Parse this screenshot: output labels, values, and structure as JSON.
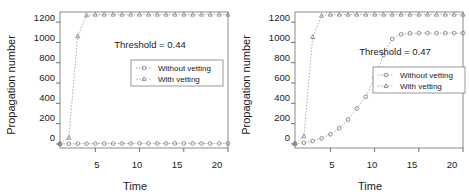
{
  "figure": {
    "panel_count": 2
  },
  "chart_data": [
    {
      "type": "line",
      "title": "",
      "panel_id": "left",
      "xlabel": "Time",
      "ylabel": "Propagation number",
      "xlim": [
        1,
        20
      ],
      "ylim": [
        -40,
        1300
      ],
      "xticks": [
        5,
        10,
        15,
        20
      ],
      "xticklabels": [
        "5",
        "10",
        "15",
        "20"
      ],
      "yticks": [
        0,
        200,
        400,
        600,
        800,
        1000,
        1200
      ],
      "yticklabels": [
        "0",
        "200",
        "400",
        "600",
        "800",
        "1000",
        "1200"
      ],
      "grid": false,
      "legend_position": "center-right",
      "annotation": "Threshold = 0.44",
      "x": [
        1,
        2,
        3,
        4,
        5,
        6,
        7,
        8,
        9,
        10,
        11,
        12,
        13,
        14,
        15,
        16,
        17,
        18,
        19,
        20
      ],
      "series": [
        {
          "name": "Without vetting",
          "marker": "circle",
          "values": [
            1,
            2,
            3,
            3,
            4,
            4,
            4,
            4,
            5,
            5,
            5,
            5,
            5,
            5,
            5,
            5,
            5,
            5,
            5,
            5
          ]
        },
        {
          "name": "With vetting",
          "marker": "triangle",
          "values": [
            3,
            62,
            1063,
            1268,
            1275,
            1275,
            1275,
            1275,
            1275,
            1275,
            1275,
            1275,
            1275,
            1275,
            1275,
            1275,
            1275,
            1275,
            1275,
            1275
          ]
        }
      ]
    },
    {
      "type": "line",
      "title": "",
      "panel_id": "right",
      "xlabel": "Time",
      "ylabel": "Propagation number",
      "xlim": [
        1,
        20
      ],
      "ylim": [
        -40,
        1300
      ],
      "xticks": [
        5,
        10,
        15,
        20
      ],
      "xticklabels": [
        "5",
        "10",
        "15",
        "20"
      ],
      "yticks": [
        0,
        200,
        400,
        600,
        800,
        1000,
        1200
      ],
      "yticklabels": [
        "0",
        "200",
        "400",
        "600",
        "800",
        "1000",
        "1200"
      ],
      "grid": false,
      "legend_position": "center-right",
      "annotation": "Threshold = 0.47",
      "x": [
        1,
        2,
        3,
        4,
        5,
        6,
        7,
        8,
        9,
        10,
        11,
        12,
        13,
        14,
        15,
        16,
        17,
        18,
        19,
        20
      ],
      "series": [
        {
          "name": "Without vetting",
          "marker": "circle",
          "values": [
            2,
            12,
            28,
            55,
            95,
            155,
            240,
            350,
            465,
            650,
            875,
            1035,
            1080,
            1090,
            1092,
            1092,
            1092,
            1092,
            1092,
            1092
          ]
        },
        {
          "name": "With vetting",
          "marker": "triangle",
          "values": [
            4,
            75,
            1055,
            1265,
            1275,
            1275,
            1275,
            1275,
            1275,
            1275,
            1275,
            1275,
            1275,
            1275,
            1275,
            1275,
            1275,
            1275,
            1275,
            1275
          ]
        }
      ]
    }
  ]
}
